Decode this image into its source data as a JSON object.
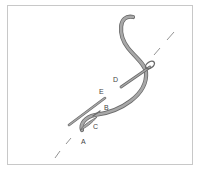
{
  "diagram": {
    "type": "embroidery-stitch-illustration",
    "labels": [
      {
        "id": "A",
        "text": "A"
      },
      {
        "id": "B",
        "text": "B"
      },
      {
        "id": "C",
        "text": "C"
      },
      {
        "id": "D",
        "text": "D"
      },
      {
        "id": "E",
        "text": "E"
      }
    ],
    "colors": {
      "thread": "#9a9a9a",
      "outline": "#6a6a6a",
      "guide_line": "#777777",
      "border": "#c8c8c8"
    }
  }
}
